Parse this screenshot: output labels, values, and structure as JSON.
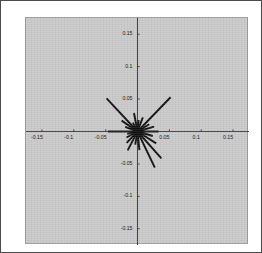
{
  "figure": {
    "title": "",
    "background_color": "#ffffff",
    "plot_background_color": "#c9c9c9",
    "border_color": "#4a4a4a",
    "axis_color": "#2a2a2a",
    "data_color": "#101010"
  },
  "chart_data": {
    "type": "line",
    "title": "",
    "xlabel": "",
    "ylabel": "",
    "xlim": [
      -0.175,
      0.175
    ],
    "ylim": [
      -0.175,
      0.175
    ],
    "xticks": [
      -0.15,
      -0.1,
      -0.05,
      0.05,
      0.1,
      0.15
    ],
    "yticks": [
      -0.15,
      -0.1,
      -0.05,
      0.05,
      0.1,
      0.15
    ],
    "xticklabels": [
      "-0.15",
      "-0.1",
      "-0.05",
      "0.05",
      "0.1",
      "0.15"
    ],
    "yticklabels": [
      "-0.15",
      "-0.1",
      "-0.05",
      "0.05",
      "0.1",
      "0.15"
    ],
    "grid": false,
    "legend": null,
    "origin": [
      0,
      0
    ],
    "series": [
      {
        "name": "rays",
        "representation": "polar-segments-from-origin",
        "angle_unit": "degrees",
        "points": [
          {
            "angle": 180.0,
            "radius": 0.0465,
            "x": -0.0465,
            "y": 0.0
          },
          {
            "angle": 160.0,
            "radius": 0.0205,
            "x": -0.0193,
            "y": 0.007
          },
          {
            "angle": 146.0,
            "radius": 0.03,
            "x": -0.0249,
            "y": 0.0168
          },
          {
            "angle": 133.5,
            "radius": 0.0705,
            "x": -0.0485,
            "y": 0.0511
          },
          {
            "angle": 118.0,
            "radius": 0.0155,
            "x": -0.0073,
            "y": 0.0137
          },
          {
            "angle": 101.0,
            "radius": 0.029,
            "x": -0.0055,
            "y": 0.0285
          },
          {
            "angle": 84.0,
            "radius": 0.0175,
            "x": 0.0018,
            "y": 0.0174
          },
          {
            "angle": 69.0,
            "radius": 0.0235,
            "x": 0.0084,
            "y": 0.0219
          },
          {
            "angle": 45.5,
            "radius": 0.074,
            "x": 0.0519,
            "y": 0.0528
          },
          {
            "angle": 31.0,
            "radius": 0.0215,
            "x": 0.0184,
            "y": 0.0111
          },
          {
            "angle": 16.0,
            "radius": 0.027,
            "x": 0.026,
            "y": 0.0074
          },
          {
            "angle": 0.0,
            "radius": 0.033,
            "x": 0.033,
            "y": 0.0
          },
          {
            "angle": -16.0,
            "radius": 0.025,
            "x": 0.024,
            "y": -0.0069
          },
          {
            "angle": -32.0,
            "radius": 0.0345,
            "x": 0.0293,
            "y": -0.0183
          },
          {
            "angle": -48.0,
            "radius": 0.056,
            "x": 0.0375,
            "y": -0.0416
          },
          {
            "angle": -64.0,
            "radius": 0.062,
            "x": 0.0272,
            "y": -0.0557
          },
          {
            "angle": -84.0,
            "radius": 0.029,
            "x": 0.003,
            "y": -0.0288
          },
          {
            "angle": -100.0,
            "radius": 0.0205,
            "x": -0.0036,
            "y": -0.0202
          },
          {
            "angle": -118.0,
            "radius": 0.033,
            "x": -0.0155,
            "y": -0.0291
          },
          {
            "angle": -134.0,
            "radius": 0.0245,
            "x": -0.017,
            "y": -0.0176
          },
          {
            "angle": -152.0,
            "radius": 0.0195,
            "x": -0.0172,
            "y": -0.0092
          },
          {
            "angle": -167.0,
            "radius": 0.0165,
            "x": -0.0161,
            "y": -0.0037
          }
        ]
      }
    ]
  }
}
